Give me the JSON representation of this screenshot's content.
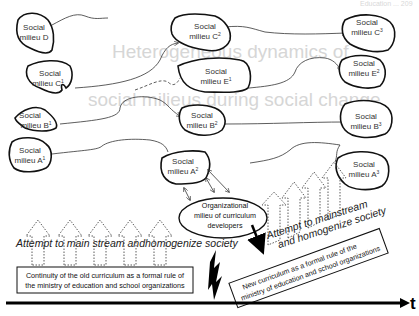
{
  "header": {
    "running_text": "Education ... 209"
  },
  "background_titles": {
    "line1": "Heterogeneous dynamics of",
    "line2": "social milieus during social change"
  },
  "nodes": {
    "D": {
      "line1": "Social",
      "line2": "milieu D"
    },
    "C1": {
      "line1": "Social",
      "line2": "milieu C",
      "sup": "1"
    },
    "B1": {
      "line1": "Social",
      "line2": "milieu B",
      "sup": "1"
    },
    "A1": {
      "line1": "Social",
      "line2": "milieu A",
      "sup": "1"
    },
    "C2": {
      "line1": "Social",
      "line2": "milieu C",
      "sup": "2"
    },
    "E1": {
      "line1": "Social",
      "line2": "milieu E",
      "sup": "1"
    },
    "B2": {
      "line1": "Social",
      "line2": "milieu B",
      "sup": "2"
    },
    "A2": {
      "line1": "Social",
      "line2": "milieu A",
      "sup": "2"
    },
    "C3": {
      "line1": "Social",
      "line2": "milieu C",
      "sup": "3"
    },
    "E2": {
      "line1": "Social",
      "line2": "milieu E",
      "sup": "2"
    },
    "B3": {
      "line1": "Social",
      "line2": "milieu B",
      "sup": "3"
    },
    "A3": {
      "line1": "Social",
      "line2": "milieu A",
      "sup": "3"
    }
  },
  "organizational": {
    "line1": "Organizational",
    "line2": "milieu of curriculum",
    "line3": "developers"
  },
  "attempt_left": "Attempt to main stream andhomogenize society",
  "attempt_right": {
    "line1": "Attempt to mainstream",
    "line2": "and homogenize society"
  },
  "old_curriculum_box": {
    "line1": "Continuity of the old curriculum as a formal rule of",
    "line2": "the ministry of education and school organizations"
  },
  "new_curriculum_box": {
    "line1": "New curriculum as a formal rule of the",
    "line2": "ministry of education and school organizations"
  },
  "time_axis": {
    "label": "t"
  },
  "colors": {
    "ink": "#111111",
    "faint_title": "#d6d6d6",
    "background": "#ffffff"
  }
}
